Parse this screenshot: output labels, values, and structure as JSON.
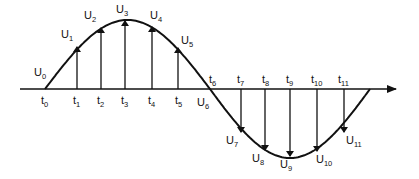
{
  "diagram": {
    "type": "sine-wave-sampling",
    "colors": {
      "stroke": "#111111",
      "background": "#ffffff"
    },
    "axis": {
      "y": 89,
      "x_start": 20,
      "x_end": 396
    },
    "curve": {
      "start_x": 45,
      "zero_cross_x": 210,
      "end_x": 370,
      "peak_y": 20,
      "trough_y": 158
    },
    "time_labels": [
      {
        "base": "t",
        "sub": "0",
        "x": 41,
        "y": 104
      },
      {
        "base": "t",
        "sub": "1",
        "x": 73,
        "y": 104
      },
      {
        "base": "t",
        "sub": "2",
        "x": 97,
        "y": 104
      },
      {
        "base": "t",
        "sub": "3",
        "x": 121,
        "y": 104
      },
      {
        "base": "t",
        "sub": "4",
        "x": 148,
        "y": 104
      },
      {
        "base": "t",
        "sub": "5",
        "x": 175,
        "y": 104
      },
      {
        "base": "t",
        "sub": "6",
        "x": 209,
        "y": 83
      },
      {
        "base": "t",
        "sub": "7",
        "x": 237,
        "y": 83
      },
      {
        "base": "t",
        "sub": "8",
        "x": 262,
        "y": 83
      },
      {
        "base": "t",
        "sub": "9",
        "x": 286,
        "y": 83
      },
      {
        "base": "t",
        "sub": "10",
        "x": 311,
        "y": 83
      },
      {
        "base": "t",
        "sub": "11",
        "x": 338,
        "y": 83
      }
    ],
    "sample_labels": [
      {
        "base": "U",
        "sub": "0",
        "x": 34,
        "y": 76
      },
      {
        "base": "U",
        "sub": "1",
        "x": 61,
        "y": 38
      },
      {
        "base": "U",
        "sub": "2",
        "x": 84,
        "y": 19
      },
      {
        "base": "U",
        "sub": "3",
        "x": 116,
        "y": 13
      },
      {
        "base": "U",
        "sub": "4",
        "x": 150,
        "y": 19
      },
      {
        "base": "U",
        "sub": "5",
        "x": 181,
        "y": 44
      },
      {
        "base": "U",
        "sub": "6",
        "x": 197,
        "y": 106
      },
      {
        "base": "U",
        "sub": "7",
        "x": 226,
        "y": 144
      },
      {
        "base": "U",
        "sub": "8",
        "x": 252,
        "y": 162
      },
      {
        "base": "U",
        "sub": "9",
        "x": 280,
        "y": 168
      },
      {
        "base": "U",
        "sub": "10",
        "x": 316,
        "y": 163
      },
      {
        "base": "U",
        "sub": "11",
        "x": 346,
        "y": 144
      }
    ],
    "sample_arrows": [
      {
        "name": "arrow-u1",
        "x": 77,
        "y_tip": 47,
        "direction": "up"
      },
      {
        "name": "arrow-u2",
        "x": 101,
        "y_tip": 28,
        "direction": "up"
      },
      {
        "name": "arrow-u3",
        "x": 125,
        "y_tip": 21,
        "direction": "up"
      },
      {
        "name": "arrow-u4",
        "x": 152,
        "y_tip": 27,
        "direction": "up"
      },
      {
        "name": "arrow-u5",
        "x": 178,
        "y_tip": 48,
        "direction": "up"
      },
      {
        "name": "arrow-u7",
        "x": 241,
        "y_tip": 132,
        "direction": "down"
      },
      {
        "name": "arrow-u8",
        "x": 265,
        "y_tip": 150,
        "direction": "down"
      },
      {
        "name": "arrow-u9",
        "x": 290,
        "y_tip": 156,
        "direction": "down"
      },
      {
        "name": "arrow-u10",
        "x": 317,
        "y_tip": 151,
        "direction": "down"
      },
      {
        "name": "arrow-u11",
        "x": 344,
        "y_tip": 132,
        "direction": "down"
      }
    ]
  }
}
